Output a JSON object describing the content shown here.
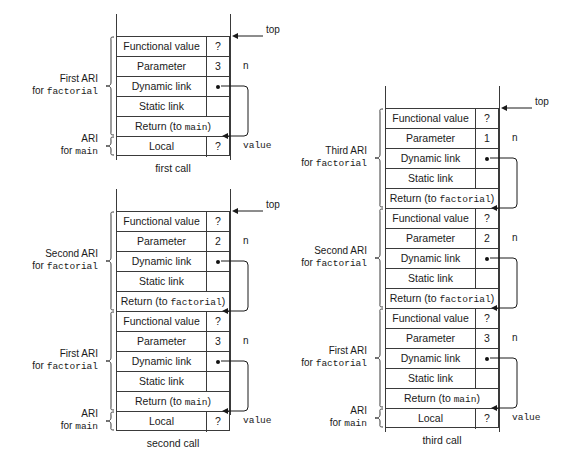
{
  "figure": {
    "title": "Activation record instances for recursive factorial calls",
    "row_labels": {
      "functional_value": "Functional value",
      "parameter": "Parameter",
      "dynamic_link": "Dynamic link",
      "static_link": "Static link",
      "return_to_main": "Return (to main)",
      "return_to_factorial_prefix": "Return (to",
      "return_to_factorial_name": "factorial",
      "return_to_factorial_suffix": ")",
      "local": "Local"
    },
    "annotations": {
      "top": "top",
      "n": "n",
      "value": "value"
    },
    "unknown_value": "?"
  },
  "diagrams": [
    {
      "id": "first-call",
      "caption": "first call",
      "frames": [
        {
          "label_line1": "First ARI",
          "label_line2_prefix": "for ",
          "label_line2_mono": "factorial",
          "rows": [
            {
              "name": "functional-value",
              "label": "Functional value",
              "value": "?",
              "split": true,
              "dot": false
            },
            {
              "name": "parameter",
              "label": "Parameter",
              "value": "3",
              "split": true,
              "dot": false,
              "annot": "n"
            },
            {
              "name": "dynamic-link",
              "label": "Dynamic link",
              "value": "",
              "split": true,
              "dot": true
            },
            {
              "name": "static-link",
              "label": "Static link",
              "value": "",
              "split": true,
              "dot": false
            },
            {
              "name": "return-link",
              "label": "Return (to main)",
              "value": "",
              "split": false,
              "dot": false,
              "mono_word": "main"
            }
          ]
        },
        {
          "label_line1": "ARI",
          "label_line2_prefix": "for ",
          "label_line2_mono": "main",
          "rows": [
            {
              "name": "local",
              "label": "Local",
              "value": "?",
              "split": true,
              "dot": false,
              "annot": "value"
            }
          ]
        }
      ]
    },
    {
      "id": "second-call",
      "caption": "second call",
      "frames": [
        {
          "label_line1": "Second ARI",
          "label_line2_prefix": "for ",
          "label_line2_mono": "factorial",
          "rows": [
            {
              "name": "functional-value",
              "label": "Functional value",
              "value": "?",
              "split": true,
              "dot": false
            },
            {
              "name": "parameter",
              "label": "Parameter",
              "value": "2",
              "split": true,
              "dot": false,
              "annot": "n"
            },
            {
              "name": "dynamic-link",
              "label": "Dynamic link",
              "value": "",
              "split": true,
              "dot": true
            },
            {
              "name": "static-link",
              "label": "Static link",
              "value": "",
              "split": true,
              "dot": false
            },
            {
              "name": "return-link",
              "label": "Return (to factorial)",
              "value": "",
              "split": false,
              "dot": false,
              "mono_word": "factorial"
            }
          ]
        },
        {
          "label_line1": "First ARI",
          "label_line2_prefix": "for ",
          "label_line2_mono": "factorial",
          "rows": [
            {
              "name": "functional-value",
              "label": "Functional value",
              "value": "?",
              "split": true,
              "dot": false
            },
            {
              "name": "parameter",
              "label": "Parameter",
              "value": "3",
              "split": true,
              "dot": false,
              "annot": "n"
            },
            {
              "name": "dynamic-link",
              "label": "Dynamic link",
              "value": "",
              "split": true,
              "dot": true
            },
            {
              "name": "static-link",
              "label": "Static link",
              "value": "",
              "split": true,
              "dot": false
            },
            {
              "name": "return-link",
              "label": "Return (to main)",
              "value": "",
              "split": false,
              "dot": false,
              "mono_word": "main"
            }
          ]
        },
        {
          "label_line1": "ARI",
          "label_line2_prefix": "for ",
          "label_line2_mono": "main",
          "rows": [
            {
              "name": "local",
              "label": "Local",
              "value": "?",
              "split": true,
              "dot": false,
              "annot": "value"
            }
          ]
        }
      ]
    },
    {
      "id": "third-call",
      "caption": "third call",
      "frames": [
        {
          "label_line1": "Third ARI",
          "label_line2_prefix": "for ",
          "label_line2_mono": "factorial",
          "rows": [
            {
              "name": "functional-value",
              "label": "Functional value",
              "value": "?",
              "split": true,
              "dot": false
            },
            {
              "name": "parameter",
              "label": "Parameter",
              "value": "1",
              "split": true,
              "dot": false,
              "annot": "n"
            },
            {
              "name": "dynamic-link",
              "label": "Dynamic link",
              "value": "",
              "split": true,
              "dot": true
            },
            {
              "name": "static-link",
              "label": "Static link",
              "value": "",
              "split": true,
              "dot": false
            },
            {
              "name": "return-link",
              "label": "Return (to factorial)",
              "value": "",
              "split": false,
              "dot": false,
              "mono_word": "factorial"
            }
          ]
        },
        {
          "label_line1": "Second ARI",
          "label_line2_prefix": "for ",
          "label_line2_mono": "factorial",
          "rows": [
            {
              "name": "functional-value",
              "label": "Functional value",
              "value": "?",
              "split": true,
              "dot": false
            },
            {
              "name": "parameter",
              "label": "Parameter",
              "value": "2",
              "split": true,
              "dot": false,
              "annot": "n"
            },
            {
              "name": "dynamic-link",
              "label": "Dynamic link",
              "value": "",
              "split": true,
              "dot": true
            },
            {
              "name": "static-link",
              "label": "Static link",
              "value": "",
              "split": true,
              "dot": false
            },
            {
              "name": "return-link",
              "label": "Return (to factorial)",
              "value": "",
              "split": false,
              "dot": false,
              "mono_word": "factorial"
            }
          ]
        },
        {
          "label_line1": "First ARI",
          "label_line2_prefix": "for ",
          "label_line2_mono": "factorial",
          "rows": [
            {
              "name": "functional-value",
              "label": "Functional value",
              "value": "?",
              "split": true,
              "dot": false
            },
            {
              "name": "parameter",
              "label": "Parameter",
              "value": "3",
              "split": true,
              "dot": false,
              "annot": "n"
            },
            {
              "name": "dynamic-link",
              "label": "Dynamic link",
              "value": "",
              "split": true,
              "dot": true
            },
            {
              "name": "static-link",
              "label": "Static link",
              "value": "",
              "split": true,
              "dot": false
            },
            {
              "name": "return-link",
              "label": "Return (to main)",
              "value": "",
              "split": false,
              "dot": false,
              "mono_word": "main"
            }
          ]
        },
        {
          "label_line1": "ARI",
          "label_line2_prefix": "for ",
          "label_line2_mono": "main",
          "rows": [
            {
              "name": "local",
              "label": "Local",
              "value": "?",
              "split": true,
              "dot": false,
              "annot": "value"
            }
          ]
        }
      ]
    }
  ]
}
